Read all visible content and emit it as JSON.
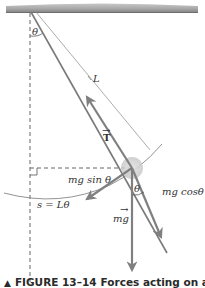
{
  "figure": {
    "caption": {
      "marker": "▲",
      "number": "FIGURE 13–14",
      "text": "Forces acting on a"
    },
    "labels": {
      "theta_top": "θ",
      "length": "L",
      "tension": "T",
      "tension_vector_mark": "→",
      "mg_sin": "mg sin θ",
      "mg_cos": "mg cosθ",
      "theta_bob": "θ",
      "weight": "mg",
      "weight_vector_mark": "→",
      "arc_length": "s = Lθ"
    },
    "colors": {
      "ceiling": "#9a9a9a",
      "string": "#777777",
      "arrow": "#8a8a8a",
      "dashed": "#555555",
      "bob": "#d0d0d0",
      "text": "#333333"
    }
  }
}
